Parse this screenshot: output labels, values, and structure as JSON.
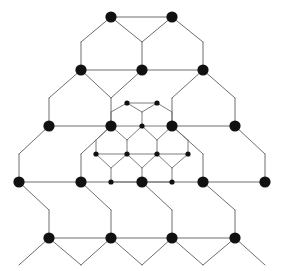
{
  "figure": {
    "background_color": "#ffffff",
    "canvas": {
      "width": 290,
      "height": 271
    }
  },
  "style": {
    "outer_edge_color": "#6e6e6e",
    "outer_edge_width": 1.0,
    "inner_edge_color": "#6e6e6e",
    "inner_edge_width": 0.9,
    "outer_node_color": "#111111",
    "inner_node_color": "#111111",
    "outer_node_radius": 5.6,
    "inner_node_radius": 2.6
  },
  "chart_data": {
    "type": "scatter",
    "xlabel": "",
    "ylabel": "",
    "grid": false,
    "legend": "none",
    "xlim": [
      0,
      290
    ],
    "ylim": [
      0,
      271
    ],
    "lattice": {
      "outer": {
        "name": "large honeycomb",
        "lattice_constant_x": 61,
        "lattice_constant_y": 56,
        "node_count": 24,
        "edge_count": 33,
        "row_y_values": [
          17,
          70,
          126,
          182,
          238
        ],
        "nodes": [
          {
            "id": "o1",
            "x": 111,
            "y": 17,
            "row": 0,
            "size": "large"
          },
          {
            "id": "o2",
            "x": 172,
            "y": 17,
            "row": 0,
            "size": "large"
          },
          {
            "id": "o3",
            "x": 81,
            "y": 70,
            "row": 1,
            "size": "large"
          },
          {
            "id": "o4",
            "x": 142,
            "y": 70,
            "row": 1,
            "size": "large"
          },
          {
            "id": "o5",
            "x": 203,
            "y": 70,
            "row": 1,
            "size": "large"
          },
          {
            "id": "o6",
            "x": 49,
            "y": 126,
            "row": 2,
            "size": "large"
          },
          {
            "id": "o7",
            "x": 111,
            "y": 126,
            "row": 2,
            "size": "large"
          },
          {
            "id": "o8",
            "x": 172,
            "y": 126,
            "row": 2,
            "size": "large"
          },
          {
            "id": "o9",
            "x": 235,
            "y": 126,
            "row": 2,
            "size": "large"
          },
          {
            "id": "o10",
            "x": 19,
            "y": 182,
            "row": 3,
            "size": "large"
          },
          {
            "id": "o11",
            "x": 81,
            "y": 182,
            "row": 3,
            "size": "large"
          },
          {
            "id": "o12",
            "x": 142,
            "y": 182,
            "row": 3,
            "size": "large"
          },
          {
            "id": "o13",
            "x": 203,
            "y": 182,
            "row": 3,
            "size": "large"
          },
          {
            "id": "o14",
            "x": 265,
            "y": 182,
            "row": 3,
            "size": "large"
          },
          {
            "id": "o15",
            "x": 49,
            "y": 238,
            "row": 4,
            "size": "large"
          },
          {
            "id": "o16",
            "x": 111,
            "y": 238,
            "row": 4,
            "size": "large"
          },
          {
            "id": "o17",
            "x": 172,
            "y": 238,
            "row": 4,
            "size": "large"
          },
          {
            "id": "o18",
            "x": 235,
            "y": 238,
            "row": 4,
            "size": "large"
          }
        ],
        "edges": [
          [
            111,
            17,
            172,
            17
          ],
          [
            111,
            17,
            81,
            42
          ],
          [
            172,
            17,
            203,
            42
          ],
          [
            81,
            42,
            81,
            70
          ],
          [
            203,
            42,
            203,
            70
          ],
          [
            142,
            42,
            111,
            17
          ],
          [
            142,
            42,
            172,
            17
          ],
          [
            142,
            42,
            142,
            70
          ],
          [
            81,
            70,
            142,
            70
          ],
          [
            142,
            70,
            203,
            70
          ],
          [
            81,
            70,
            49,
            98
          ],
          [
            49,
            98,
            49,
            126
          ],
          [
            142,
            70,
            111,
            98
          ],
          [
            111,
            98,
            111,
            126
          ],
          [
            203,
            70,
            235,
            98
          ],
          [
            235,
            98,
            235,
            126
          ],
          [
            81,
            70,
            111,
            98
          ],
          [
            203,
            70,
            172,
            98
          ],
          [
            172,
            98,
            172,
            126
          ],
          [
            49,
            126,
            111,
            126
          ],
          [
            172,
            126,
            235,
            126
          ],
          [
            49,
            126,
            19,
            154
          ],
          [
            19,
            154,
            19,
            182
          ],
          [
            111,
            126,
            81,
            154
          ],
          [
            81,
            154,
            81,
            182
          ],
          [
            235,
            126,
            265,
            154
          ],
          [
            265,
            154,
            265,
            182
          ],
          [
            172,
            126,
            203,
            154
          ],
          [
            203,
            154,
            203,
            182
          ],
          [
            19,
            182,
            81,
            182
          ],
          [
            81,
            182,
            142,
            182
          ],
          [
            142,
            182,
            203,
            182
          ],
          [
            203,
            182,
            265,
            182
          ],
          [
            19,
            182,
            49,
            210
          ],
          [
            49,
            210,
            49,
            238
          ],
          [
            81,
            182,
            111,
            210
          ],
          [
            111,
            210,
            111,
            238
          ],
          [
            142,
            182,
            172,
            210
          ],
          [
            172,
            210,
            172,
            238
          ],
          [
            203,
            182,
            235,
            210
          ],
          [
            235,
            210,
            235,
            238
          ],
          [
            49,
            238,
            111,
            238
          ],
          [
            111,
            238,
            172,
            238
          ],
          [
            172,
            238,
            235,
            238
          ],
          [
            49,
            238,
            19,
            265
          ],
          [
            111,
            238,
            142,
            265
          ],
          [
            172,
            238,
            142,
            265
          ],
          [
            235,
            238,
            265,
            265
          ],
          [
            49,
            238,
            81,
            265
          ],
          [
            111,
            238,
            81,
            265
          ],
          [
            172,
            238,
            203,
            265
          ],
          [
            235,
            238,
            203,
            265
          ]
        ]
      },
      "inner": {
        "name": "small nested honeycomb",
        "lattice_constant_x": 30.5,
        "lattice_constant_y": 28,
        "node_count": 14,
        "row_y_values": [
          103,
          126,
          154,
          182
        ],
        "nodes": [
          {
            "id": "i1",
            "x": 127,
            "y": 103,
            "row": 0,
            "size": "small"
          },
          {
            "id": "i2",
            "x": 157,
            "y": 103,
            "row": 0,
            "size": "small"
          },
          {
            "id": "i3",
            "x": 111,
            "y": 126,
            "row": 1,
            "size": "large-shared"
          },
          {
            "id": "i4",
            "x": 142,
            "y": 126,
            "row": 1,
            "size": "small"
          },
          {
            "id": "i5",
            "x": 172,
            "y": 126,
            "row": 1,
            "size": "large-shared"
          },
          {
            "id": "i6",
            "x": 96,
            "y": 154,
            "row": 2,
            "size": "small"
          },
          {
            "id": "i7",
            "x": 127,
            "y": 154,
            "row": 2,
            "size": "small"
          },
          {
            "id": "i8",
            "x": 157,
            "y": 154,
            "row": 2,
            "size": "small"
          },
          {
            "id": "i9",
            "x": 188,
            "y": 154,
            "row": 2,
            "size": "small"
          },
          {
            "id": "i10",
            "x": 111,
            "y": 182,
            "row": 3,
            "size": "small"
          },
          {
            "id": "i11",
            "x": 142,
            "y": 182,
            "row": 3,
            "size": "large-shared"
          },
          {
            "id": "i12",
            "x": 172,
            "y": 182,
            "row": 3,
            "size": "small"
          }
        ],
        "edges": [
          [
            127,
            103,
            157,
            103
          ],
          [
            127,
            103,
            111,
            112
          ],
          [
            111,
            112,
            111,
            126
          ],
          [
            157,
            103,
            172,
            112
          ],
          [
            172,
            112,
            172,
            126
          ],
          [
            127,
            103,
            142,
            112
          ],
          [
            157,
            103,
            142,
            112
          ],
          [
            142,
            112,
            142,
            126
          ],
          [
            111,
            126,
            142,
            126
          ],
          [
            142,
            126,
            172,
            126
          ],
          [
            111,
            126,
            96,
            140
          ],
          [
            96,
            140,
            96,
            154
          ],
          [
            142,
            126,
            127,
            140
          ],
          [
            127,
            140,
            127,
            154
          ],
          [
            111,
            126,
            127,
            140
          ],
          [
            142,
            126,
            157,
            140
          ],
          [
            157,
            140,
            157,
            154
          ],
          [
            172,
            126,
            157,
            140
          ],
          [
            172,
            126,
            188,
            140
          ],
          [
            188,
            140,
            188,
            154
          ],
          [
            96,
            154,
            127,
            154
          ],
          [
            127,
            154,
            157,
            154
          ],
          [
            157,
            154,
            188,
            154
          ],
          [
            96,
            154,
            111,
            168
          ],
          [
            111,
            168,
            111,
            182
          ],
          [
            127,
            154,
            111,
            168
          ],
          [
            157,
            154,
            142,
            168
          ],
          [
            142,
            168,
            142,
            182
          ],
          [
            127,
            154,
            142,
            168
          ],
          [
            157,
            154,
            172,
            168
          ],
          [
            188,
            154,
            172,
            168
          ],
          [
            172,
            168,
            172,
            182
          ],
          [
            111,
            182,
            142,
            182
          ],
          [
            142,
            182,
            172,
            182
          ]
        ]
      }
    }
  }
}
